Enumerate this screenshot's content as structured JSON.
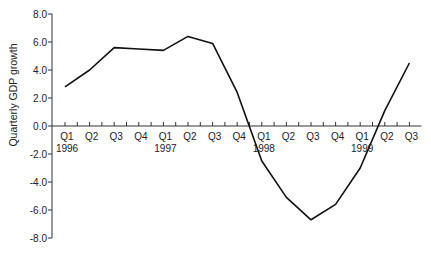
{
  "chart_data": {
    "type": "line",
    "title": "",
    "xlabel": "",
    "ylabel": "Quarterly GDP growth",
    "ylim": [
      -8.0,
      8.0
    ],
    "yticks": [
      "8.0",
      "6.0",
      "4.0",
      "2.0",
      "0.0",
      "-2.0",
      "-4.0",
      "-6.0",
      "-8.0"
    ],
    "ytick_values": [
      8,
      6,
      4,
      2,
      0,
      -2,
      -4,
      -6,
      -8
    ],
    "grid": false,
    "legend": null,
    "categories": [
      "Q1",
      "Q2",
      "Q3",
      "Q4",
      "Q1",
      "Q2",
      "Q3",
      "Q4",
      "Q1",
      "Q2",
      "Q3",
      "Q4",
      "Q1",
      "Q2",
      "Q3"
    ],
    "year_labels": [
      {
        "index": 0,
        "label": "1996"
      },
      {
        "index": 4,
        "label": "1997"
      },
      {
        "index": 8,
        "label": "1998"
      },
      {
        "index": 12,
        "label": "1999"
      }
    ],
    "series": [
      {
        "name": "Quarterly GDP growth",
        "color": "#111111",
        "values": [
          2.8,
          4.0,
          5.6,
          5.5,
          5.4,
          6.4,
          5.9,
          2.4,
          -2.5,
          -5.1,
          -6.7,
          -5.6,
          -3.0,
          1.1,
          4.5
        ]
      }
    ]
  }
}
